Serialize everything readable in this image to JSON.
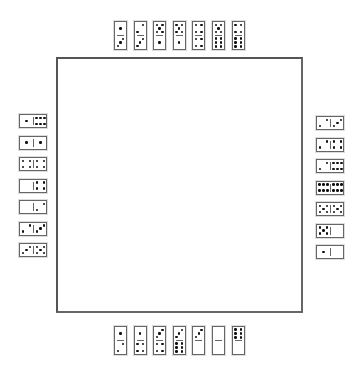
{
  "game": "Dominoes",
  "board": {
    "label": "play-area"
  },
  "hands": {
    "top": [
      [
        1,
        3
      ],
      [
        2,
        3
      ],
      [
        5,
        1
      ],
      [
        5,
        1
      ],
      [
        4,
        4
      ],
      [
        5,
        6
      ],
      [
        4,
        6
      ]
    ],
    "left": [
      [
        1,
        6
      ],
      [
        1,
        1
      ],
      [
        4,
        4
      ],
      [
        0,
        4
      ],
      [
        0,
        2
      ],
      [
        2,
        3
      ],
      [
        3,
        5
      ]
    ],
    "right": [
      [
        2,
        3
      ],
      [
        2,
        4
      ],
      [
        2,
        6
      ],
      [
        6,
        6
      ],
      [
        5,
        5
      ],
      [
        5,
        0
      ],
      [
        1,
        0
      ]
    ],
    "bottom": [
      [
        1,
        2
      ],
      [
        1,
        4
      ],
      [
        3,
        4
      ],
      [
        3,
        6
      ],
      [
        3,
        0
      ],
      [
        0,
        0
      ],
      [
        6,
        0
      ]
    ]
  },
  "colors": {
    "pip": "#111111",
    "border": "#666666",
    "board_border": "#555555"
  }
}
